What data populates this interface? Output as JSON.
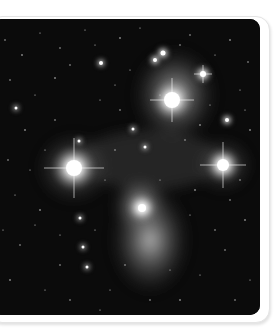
{
  "image": {
    "subject": "Pleiades star cluster (M45) with reflection nebulosity",
    "style": "grayscale astrophotograph",
    "frame": "white rounded-corner card with soft shadow",
    "colors": {
      "background": "#ffffff",
      "sky": "#0a0a0a",
      "nebula": "#bdbdbd",
      "star": "#ffffff"
    },
    "bright_stars": [
      {
        "x": 74,
        "y": 168,
        "r": 14
      },
      {
        "x": 172,
        "y": 100,
        "r": 13
      },
      {
        "x": 223,
        "y": 165,
        "r": 11
      },
      {
        "x": 142,
        "y": 208,
        "r": 9
      },
      {
        "x": 203,
        "y": 74,
        "r": 6
      },
      {
        "x": 163,
        "y": 53,
        "r": 5
      },
      {
        "x": 155,
        "y": 60,
        "r": 4
      },
      {
        "x": 227,
        "y": 120,
        "r": 4
      },
      {
        "x": 101,
        "y": 63,
        "r": 4
      },
      {
        "x": 79,
        "y": 141,
        "r": 3
      },
      {
        "x": 145,
        "y": 147,
        "r": 3
      },
      {
        "x": 80,
        "y": 218,
        "r": 3
      },
      {
        "x": 87,
        "y": 267,
        "r": 3
      },
      {
        "x": 83,
        "y": 247,
        "r": 3
      },
      {
        "x": 133,
        "y": 129,
        "r": 3
      },
      {
        "x": 16,
        "y": 108,
        "r": 3
      }
    ]
  }
}
